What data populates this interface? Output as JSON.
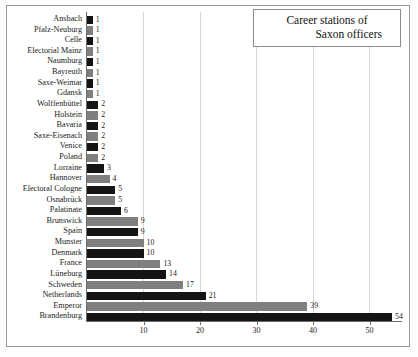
{
  "chart_data": {
    "type": "bar",
    "orientation": "horizontal",
    "title": "Career stations of Saxon officers",
    "title_lines": [
      "Career stations of",
      "Saxon officers"
    ],
    "xlabel": "",
    "ylabel": "",
    "xlim": [
      0,
      56
    ],
    "xticks": [
      10,
      20,
      30,
      40,
      50
    ],
    "grid": true,
    "grid_axis": "x",
    "legend": "none",
    "colors": {
      "black": "#141414",
      "gray": "#7f7f7f",
      "gridline": "#d7d7d7",
      "axis": "#6e6e6e",
      "frame": "#9a9a9a",
      "background": "#ffffff",
      "text": "#1b1b1b"
    },
    "categories": [
      "Ansbach",
      "Pfalz-Neuburg",
      "Celle",
      "Electorial Mainz",
      "Naumburg",
      "Bayreuth",
      "Saxe-Weimar",
      "Gdansk",
      "Wolffenbüttel",
      "Holstein",
      "Bavaria",
      "Saxe-Eisenach",
      "Venice",
      "Poland",
      "Lorraine",
      "Hannover",
      "Electoral Cologne",
      "Osnabrück",
      "Palatinate",
      "Brunswick",
      "Spain",
      "Munster",
      "Denmark",
      "France",
      "Lüneburg",
      "Schweden",
      "Netherlands",
      "Emperor",
      "Brandenburg"
    ],
    "values": [
      1,
      1,
      1,
      1,
      1,
      1,
      1,
      1,
      2,
      2,
      2,
      2,
      2,
      2,
      3,
      4,
      5,
      5,
      6,
      9,
      9,
      10,
      10,
      13,
      14,
      17,
      21,
      39,
      54
    ],
    "bar_colors": [
      "black",
      "gray",
      "black",
      "gray",
      "black",
      "gray",
      "black",
      "gray",
      "black",
      "gray",
      "black",
      "gray",
      "black",
      "gray",
      "black",
      "gray",
      "black",
      "gray",
      "black",
      "gray",
      "black",
      "gray",
      "black",
      "gray",
      "black",
      "gray",
      "black",
      "gray",
      "black"
    ],
    "data_labels": [
      "1",
      "1",
      "1",
      "1",
      "1",
      "1",
      "1",
      "1",
      "2",
      "2",
      "2",
      "2",
      "2",
      "2",
      "3",
      "4",
      "5",
      "5",
      "6",
      "9",
      "9",
      "10",
      "10",
      "13",
      "14",
      "17",
      "21",
      "39",
      "54"
    ]
  }
}
